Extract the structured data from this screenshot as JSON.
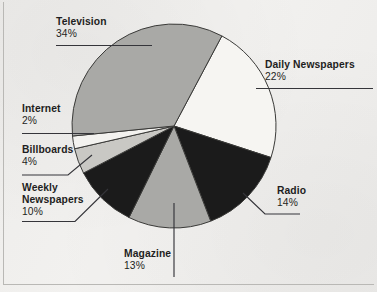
{
  "figure": {
    "background_color": "#f2f1ef",
    "outline_color": "#3a3a38"
  },
  "chart_data": {
    "type": "pie",
    "title": "",
    "subtitle": "",
    "xlabel": "",
    "ylabel": "",
    "legend_position": "callout-labels",
    "grid": false,
    "total_percent": 99,
    "categories": [
      "Television",
      "Daily Newspapers",
      "Radio",
      "Magazine",
      "Weekly Newspapers",
      "Billboards",
      "Internet"
    ],
    "values": [
      34,
      22,
      14,
      13,
      10,
      4,
      2
    ],
    "value_labels": [
      "34%",
      "22%",
      "14%",
      "13%",
      "10%",
      "4%",
      "2%"
    ],
    "colors": [
      "#a9a9a6",
      "#f6f5f2",
      "#1b1b1b",
      "#a9a9a6",
      "#1b1b1b",
      "#c9c8c4",
      "#f3f2ef"
    ],
    "slices": [
      {
        "name": "Television",
        "value": 34,
        "value_label": "34%",
        "color": "#a9a9a6",
        "label_name": "Television",
        "label_pct": "34%"
      },
      {
        "name": "Daily Newspapers",
        "value": 22,
        "value_label": "22%",
        "color": "#f6f5f2",
        "label_name": "Daily Newspapers",
        "label_pct": "22%"
      },
      {
        "name": "Radio",
        "value": 14,
        "value_label": "14%",
        "color": "#1b1b1b",
        "label_name": "Radio",
        "label_pct": "14%"
      },
      {
        "name": "Magazine",
        "value": 13,
        "value_label": "13%",
        "color": "#a9a9a6",
        "label_name": "Magazine",
        "label_pct": "13%"
      },
      {
        "name": "Weekly Newspapers",
        "value": 10,
        "value_label": "10%",
        "color": "#1b1b1b",
        "label_name_line1": "Weekly",
        "label_name_line2": "Newspapers",
        "label_pct": "10%"
      },
      {
        "name": "Billboards",
        "value": 4,
        "value_label": "4%",
        "color": "#c9c8c4",
        "label_name": "Billboards",
        "label_pct": "4%"
      },
      {
        "name": "Internet",
        "value": 2,
        "value_label": "2%",
        "color": "#f3f2ef",
        "label_name": "Internet",
        "label_pct": "2%"
      }
    ]
  }
}
